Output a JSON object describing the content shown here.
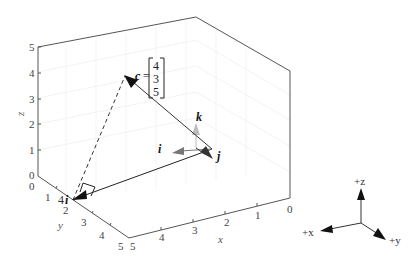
{
  "figure": {
    "type": "3d-vector-diagram",
    "axes": {
      "x": {
        "label": "x",
        "ticks": [
          "0",
          "1",
          "2",
          "3",
          "4",
          "5"
        ]
      },
      "y": {
        "label": "y",
        "ticks": [
          "0",
          "1",
          "2",
          "3",
          "4",
          "5"
        ]
      },
      "z": {
        "label": "z",
        "ticks": [
          "0",
          "1",
          "2",
          "3",
          "4",
          "5"
        ]
      }
    },
    "vectors": {
      "c": {
        "label": "c",
        "equals": "=",
        "components": [
          "4",
          "3",
          "5"
        ],
        "color": "#111111"
      },
      "i": {
        "label": "i",
        "color": "#777777"
      },
      "j": {
        "label": "j",
        "color": "#333333"
      },
      "k": {
        "label": "k",
        "color": "#bbbbbb"
      },
      "four_i": {
        "label_coef": "4",
        "label_vec": "i",
        "color": "#111111"
      }
    },
    "triad": {
      "x_label": "+x",
      "y_label": "+y",
      "z_label": "+z"
    }
  }
}
